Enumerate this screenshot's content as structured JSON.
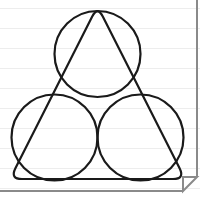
{
  "page": {
    "width": 218,
    "height": 206,
    "background_color": "#ffffff",
    "paper_style": "ruled-notebook",
    "rule_line_color": "#ededed",
    "rule_line_spacing": 20,
    "rule_line_count": 10,
    "rule_line_offsets": [
      8,
      28,
      48,
      68,
      88,
      108,
      128,
      148,
      168,
      188
    ],
    "rule_line_width": 200
  },
  "border": {
    "color": "#8a8a8a",
    "stroke_width": 2,
    "right_edge_x": 197,
    "bottom_edge_y": 191,
    "fold_size": 14,
    "fold_fill": "#ffffff",
    "fold_shadow_color": "#d8d8d8"
  },
  "figure": {
    "stroke_color": "#1a1a1a",
    "fill_color": "none",
    "stroke_width": 2.2,
    "outer_shape": {
      "name": "rounded-triangle",
      "corner_radius": 12,
      "vertices": [
        {
          "x": 97.5,
          "y": 6.0
        },
        {
          "x": 10.0,
          "y": 179.0
        },
        {
          "x": 185.0,
          "y": 179.0
        }
      ]
    },
    "circles": [
      {
        "name": "top-circle",
        "cx": 97.5,
        "cy": 54.0,
        "r": 43.0
      },
      {
        "name": "bottom-left-circle",
        "cx": 54.5,
        "cy": 137.5,
        "r": 43.0
      },
      {
        "name": "bottom-right-circle",
        "cx": 140.5,
        "cy": 137.5,
        "r": 43.0
      }
    ],
    "tangency_point": {
      "x": 97.5,
      "y": 100.0
    }
  }
}
